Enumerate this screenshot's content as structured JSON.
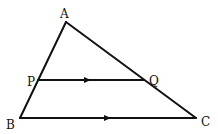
{
  "figure": {
    "type": "triangle-with-parallel-line",
    "points": {
      "A": {
        "label": "A",
        "x": 66,
        "y": 22
      },
      "B": {
        "label": "B",
        "x": 20,
        "y": 118
      },
      "C": {
        "label": "C",
        "x": 196,
        "y": 118
      },
      "P": {
        "label": "P",
        "x": 38,
        "y": 80
      },
      "Q": {
        "label": "Q",
        "x": 144,
        "y": 80
      }
    },
    "parallel_segments": [
      "PQ",
      "BC"
    ],
    "line_color": "#111111"
  }
}
